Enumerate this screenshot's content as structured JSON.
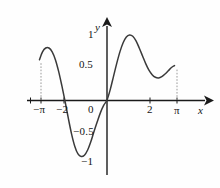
{
  "figure": {
    "name": "trigonometric-function-graph",
    "background": "#fefefe",
    "curve_color": "#3a3a3a",
    "axis_color": "#1a1a1a",
    "guide_color": "#9a9a9a"
  },
  "axes": {
    "x_axis_label": "x",
    "y_axis_label": "y",
    "x_ticks": [
      {
        "label": "−π",
        "value": -3.14159
      },
      {
        "label": "−2",
        "value": -2
      },
      {
        "label": "2",
        "value": 2
      },
      {
        "label": "π",
        "value": 3.14159
      }
    ],
    "y_ticks": [
      {
        "label": "1",
        "value": 1
      },
      {
        "label": "0.5",
        "value": 0.5
      },
      {
        "label": "0",
        "value": 0
      },
      {
        "label": "−0.5",
        "value": -0.5
      },
      {
        "label": "−1",
        "value": -1
      }
    ],
    "origin_label": "0"
  },
  "chart_data": {
    "type": "line",
    "title": "",
    "xlabel": "x",
    "ylabel": "y",
    "xlim": [
      -3.14159,
      3.14159
    ],
    "ylim": [
      -1,
      1
    ],
    "grid": false,
    "legend": "none",
    "annotations": [
      {
        "kind": "dashed-vertical",
        "x": -3.14159,
        "from_y": 0,
        "to_y": 0.62
      },
      {
        "kind": "dashed-vertical",
        "x": 3.14159,
        "from_y": 0,
        "to_y": 0.53
      }
    ],
    "series": [
      {
        "name": "f(x)",
        "x": [
          -3.14159,
          -3.0,
          -2.85,
          -2.7,
          -2.55,
          -2.4,
          -2.25,
          -2.1,
          -1.95,
          -1.8,
          -1.65,
          -1.5,
          -1.35,
          -1.2,
          -1.05,
          -0.9,
          -0.75,
          -0.6,
          -0.45,
          -0.3,
          -0.15,
          0,
          0.15,
          0.3,
          0.45,
          0.6,
          0.75,
          0.9,
          1.05,
          1.2,
          1.35,
          1.5,
          1.65,
          1.8,
          1.95,
          2.1,
          2.25,
          2.4,
          2.55,
          2.7,
          2.85,
          3.0,
          3.14159
        ],
        "y": [
          0.62,
          0.74,
          0.8,
          0.8,
          0.74,
          0.62,
          0.44,
          0.22,
          -0.02,
          -0.28,
          -0.52,
          -0.71,
          -0.83,
          -0.87,
          -0.85,
          -0.77,
          -0.64,
          -0.48,
          -0.33,
          -0.19,
          -0.08,
          0,
          0.16,
          0.36,
          0.56,
          0.74,
          0.88,
          0.97,
          1.0,
          0.98,
          0.91,
          0.8,
          0.68,
          0.56,
          0.46,
          0.39,
          0.35,
          0.34,
          0.36,
          0.4,
          0.45,
          0.5,
          0.53
        ]
      }
    ]
  }
}
